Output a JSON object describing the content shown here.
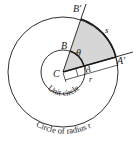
{
  "labels": {
    "B_prime": "B′",
    "B": "B",
    "theta": "θ",
    "s": "s",
    "C": "C",
    "A": "A",
    "A_prime": "A′",
    "r": "r",
    "unit_circle": "Unit circle",
    "outer_circle": "Circle of radius r"
  },
  "colors": {
    "sector_fill": "#d6d6d6",
    "stroke": "#1a1a1a",
    "background": "#ffffff"
  }
}
